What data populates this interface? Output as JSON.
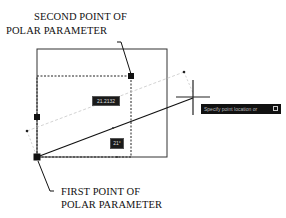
{
  "labels": {
    "second_point_line1": "SECOND POINT OF",
    "second_point_line2": "POLAR PARAMETER",
    "first_point_line1": "FIRST POINT OF",
    "first_point_line2": "POLAR PARAMETER"
  },
  "dimensions": {
    "distance_value": "21.2132",
    "angle_value": "21°"
  },
  "tooltip": {
    "text": "Specify point location or",
    "icon": "down-arrow-icon"
  },
  "colors": {
    "line": "#111111",
    "dashed": "#333333",
    "tracking": "#bbbbbb",
    "background": "#ffffff"
  }
}
